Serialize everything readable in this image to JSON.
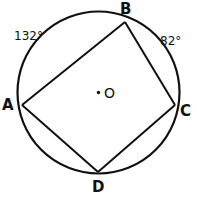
{
  "figure": {
    "kind": "circle-inscribed-quadrilateral",
    "background_color": "#ffffff",
    "stroke_color": "#111111",
    "width": 197,
    "height": 198,
    "circle": {
      "center_x": 98.5,
      "center_y": 92.5,
      "radius": 81,
      "center_marker": "dot"
    },
    "center_point": {
      "label": "O",
      "x": 98.5,
      "y": 92.5
    },
    "vertices": [
      {
        "label": "A",
        "x": 22,
        "y": 105
      },
      {
        "label": "B",
        "x": 125,
        "y": 22
      },
      {
        "label": "C",
        "x": 175,
        "y": 105
      },
      {
        "label": "D",
        "x": 98,
        "y": 172
      }
    ],
    "chords": [
      {
        "name": "chord-AB",
        "from": "A",
        "to": "B"
      },
      {
        "name": "chord-BC",
        "from": "B",
        "to": "C"
      },
      {
        "name": "chord-CD",
        "from": "C",
        "to": "D"
      },
      {
        "name": "chord-DA",
        "from": "D",
        "to": "A"
      }
    ],
    "arc_measures": [
      {
        "name": "arc-AB",
        "value": "132°",
        "arc_from": "A",
        "arc_to": "B"
      },
      {
        "name": "arc-BC",
        "value": "82°",
        "arc_from": "B",
        "arc_to": "C"
      }
    ]
  }
}
